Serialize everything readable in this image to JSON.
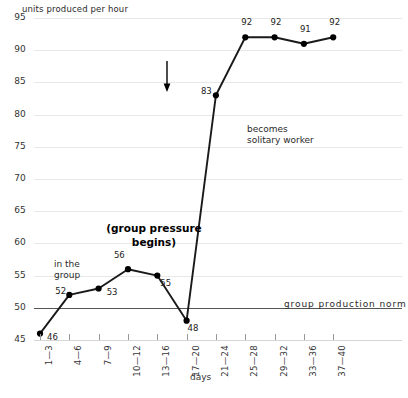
{
  "chart_data": {
    "type": "line",
    "title": "",
    "ylabel": "units produced per hour",
    "xlabel": "days",
    "ylim": [
      45,
      95
    ],
    "yticks": [
      45,
      50,
      55,
      60,
      65,
      70,
      75,
      80,
      85,
      90,
      95
    ],
    "grid": true,
    "legend": "none",
    "categories": [
      "1—3",
      "4—6",
      "7—9",
      "10—12",
      "13—16",
      "17—20",
      "21—24",
      "25—28",
      "29—32",
      "33—36",
      "37—40"
    ],
    "values": [
      46,
      52,
      53,
      56,
      55,
      48,
      83,
      92,
      92,
      91,
      92
    ],
    "point_labels": [
      "46",
      "52",
      "53",
      "56",
      "55",
      "48",
      "83",
      "92",
      "92",
      "91",
      "92"
    ],
    "reference_line": {
      "value": 50,
      "label": "group production norm"
    },
    "annotations": [
      {
        "id": "in-the-group",
        "text": "in the\ngroup",
        "bold": false
      },
      {
        "id": "group-pressure-begins",
        "text": "(group pressure\nbegins)",
        "bold": true
      },
      {
        "id": "becomes-solitary-worker",
        "text": "becomes\nsolitary worker",
        "bold": false
      }
    ],
    "colors": {
      "line": "#1a1a1a",
      "marker": "#000000",
      "grid": "#e8e8e8",
      "norm_line": "#555555",
      "background": "#ffffff"
    }
  }
}
